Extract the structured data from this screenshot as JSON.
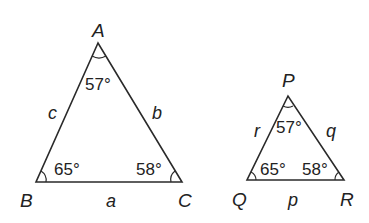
{
  "diagram": {
    "triangles": [
      {
        "name": "ABC",
        "vertices": [
          {
            "label": "A",
            "x": 98,
            "y": 43,
            "angle": "57°"
          },
          {
            "label": "B",
            "x": 36,
            "y": 182,
            "angle": "65°"
          },
          {
            "label": "C",
            "x": 182,
            "y": 182,
            "angle": "58°"
          }
        ],
        "sides": [
          {
            "label": "a",
            "between": "B-C"
          },
          {
            "label": "b",
            "between": "A-C"
          },
          {
            "label": "c",
            "between": "A-B"
          }
        ]
      },
      {
        "name": "PQR",
        "vertices": [
          {
            "label": "P",
            "x": 288,
            "y": 96,
            "angle": "57°"
          },
          {
            "label": "Q",
            "x": 247,
            "y": 180,
            "angle": "65°"
          },
          {
            "label": "R",
            "x": 344,
            "y": 180,
            "angle": "58°"
          }
        ],
        "sides": [
          {
            "label": "p",
            "between": "Q-R"
          },
          {
            "label": "q",
            "between": "P-R"
          },
          {
            "label": "r",
            "between": "P-Q"
          }
        ]
      }
    ],
    "stroke_color": "#2a2a2a",
    "background": "#ffffff"
  }
}
